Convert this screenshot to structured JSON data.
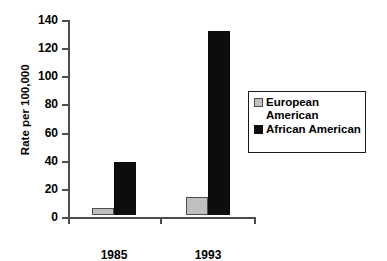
{
  "chart_data": {
    "type": "bar",
    "title": "",
    "xlabel": "",
    "ylabel": "Rate per 100,000",
    "categories": [
      "1985",
      "1993"
    ],
    "series": [
      {
        "name": "European American",
        "values": [
          5,
          13
        ],
        "color": "#bfbfbf"
      },
      {
        "name": "African American",
        "values": [
          38,
          131
        ],
        "color": "#0d0d0d"
      }
    ],
    "ylim": [
      0,
      140
    ],
    "yticks": [
      0,
      20,
      40,
      60,
      80,
      100,
      120,
      140
    ],
    "ytick_labels": [
      "0",
      "20",
      "40",
      "60",
      "80",
      "100",
      "120",
      "140"
    ],
    "grid": false,
    "legend_position": "right"
  },
  "legend": {
    "items": [
      {
        "label": "European\nAmerican",
        "swatch": "gray-swatch"
      },
      {
        "label": "African American",
        "swatch": "black-swatch"
      }
    ]
  }
}
